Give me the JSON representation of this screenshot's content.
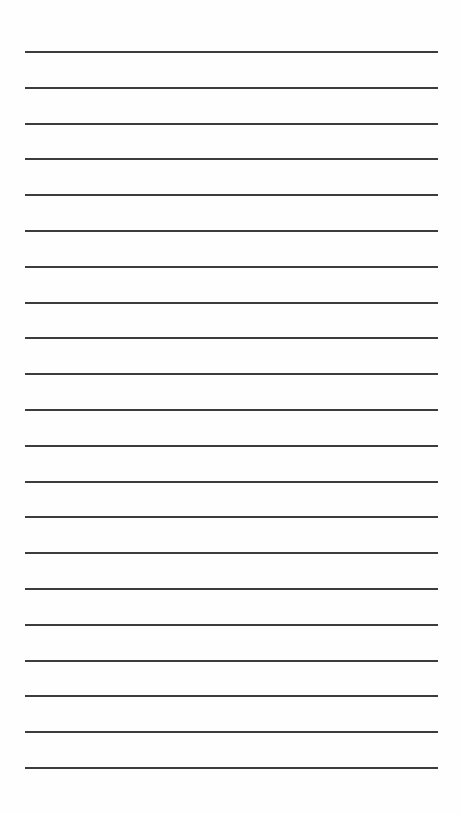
{
  "page": {
    "type": "lined-paper",
    "line_count": 21,
    "line_color": "#3c3c3c",
    "background": "#fefefe",
    "line_positions_y": [
      51,
      87,
      123,
      158,
      194,
      230,
      266,
      302,
      337,
      373,
      409,
      445,
      481,
      516,
      552,
      588,
      624,
      660,
      695,
      731,
      767
    ]
  }
}
